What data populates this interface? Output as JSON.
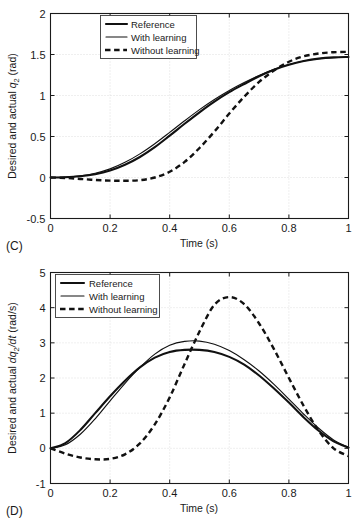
{
  "figure": {
    "panels": [
      {
        "letter": "(C)",
        "ylabel_prefix": "Desired and actual ",
        "ylabel_symbol": "q",
        "ylabel_sub": "2",
        "ylabel_suffix": " (rad)",
        "xlabel": "Time (s)",
        "legend": [
          {
            "label": "Reference",
            "style": "solid-thick"
          },
          {
            "label": "With learning",
            "style": "solid-thin"
          },
          {
            "label": "Without learning",
            "style": "dashed"
          }
        ]
      },
      {
        "letter": "(D)",
        "ylabel_prefix": "Desired and actual ",
        "ylabel_symbol": "dq",
        "ylabel_sub": "2",
        "ylabel_mid": "/dt",
        "ylabel_suffix": " (rad/s)",
        "xlabel": "Time (s)",
        "legend": [
          {
            "label": "Reference",
            "style": "solid-thick"
          },
          {
            "label": "With learning",
            "style": "solid-thin"
          },
          {
            "label": "Without learning",
            "style": "dashed"
          }
        ]
      }
    ]
  },
  "chart_data": [
    {
      "type": "line",
      "title": "",
      "panel": "(C)",
      "xlabel": "Time (s)",
      "ylabel": "Desired and actual q2 (rad)",
      "xlim": [
        0,
        1
      ],
      "ylim": [
        -0.5,
        2
      ],
      "xticks": [
        0,
        0.2,
        0.4,
        0.6,
        0.8,
        1
      ],
      "xticklabels": [
        "0",
        "0.2",
        "0.4",
        "0.6",
        "0.8",
        "1"
      ],
      "yticks": [
        -0.5,
        0,
        0.5,
        1,
        1.5,
        2
      ],
      "yticklabels": [
        "-0.5",
        "0",
        "0.5",
        "1",
        "1.5",
        "2"
      ],
      "grid": true,
      "legend_position": "upper-left",
      "x": [
        0,
        0.05,
        0.1,
        0.15,
        0.2,
        0.25,
        0.3,
        0.35,
        0.4,
        0.45,
        0.5,
        0.55,
        0.6,
        0.65,
        0.7,
        0.75,
        0.8,
        0.85,
        0.9,
        0.95,
        1
      ],
      "series": [
        {
          "name": "Reference",
          "style": "solid-thick",
          "values": [
            0,
            0.003,
            0.015,
            0.04,
            0.085,
            0.155,
            0.25,
            0.37,
            0.51,
            0.655,
            0.795,
            0.925,
            1.04,
            1.14,
            1.235,
            1.315,
            1.375,
            1.42,
            1.45,
            1.465,
            1.47
          ]
        },
        {
          "name": "With learning",
          "style": "solid-thin",
          "values": [
            0,
            0.004,
            0.02,
            0.052,
            0.105,
            0.185,
            0.288,
            0.412,
            0.55,
            0.692,
            0.828,
            0.952,
            1.062,
            1.158,
            1.245,
            1.32,
            1.378,
            1.42,
            1.448,
            1.462,
            1.468
          ]
        },
        {
          "name": "Without learning",
          "style": "dashed",
          "values": [
            0,
            -0.006,
            -0.018,
            -0.03,
            -0.038,
            -0.04,
            -0.032,
            0.0,
            0.07,
            0.19,
            0.36,
            0.56,
            0.78,
            0.985,
            1.165,
            1.305,
            1.412,
            1.478,
            1.512,
            1.528,
            1.532
          ]
        }
      ]
    },
    {
      "type": "line",
      "title": "",
      "panel": "(D)",
      "xlabel": "Time (s)",
      "ylabel": "Desired and actual dq2/dt (rad/s)",
      "xlim": [
        0,
        1
      ],
      "ylim": [
        -1,
        5
      ],
      "xticks": [
        0,
        0.2,
        0.4,
        0.6,
        0.8,
        1
      ],
      "xticklabels": [
        "0",
        "0.2",
        "0.4",
        "0.6",
        "0.8",
        "1"
      ],
      "yticks": [
        -1,
        0,
        1,
        2,
        3,
        4,
        5
      ],
      "yticklabels": [
        "-1",
        "0",
        "1",
        "2",
        "3",
        "4",
        "5"
      ],
      "grid": true,
      "legend_position": "upper-left",
      "x": [
        0,
        0.05,
        0.1,
        0.15,
        0.2,
        0.25,
        0.3,
        0.35,
        0.4,
        0.45,
        0.5,
        0.55,
        0.6,
        0.65,
        0.7,
        0.75,
        0.8,
        0.85,
        0.9,
        0.95,
        1
      ],
      "series": [
        {
          "name": "Reference",
          "style": "solid-thick",
          "values": [
            0,
            0.15,
            0.52,
            1.0,
            1.48,
            1.92,
            2.3,
            2.58,
            2.74,
            2.8,
            2.8,
            2.74,
            2.6,
            2.38,
            2.07,
            1.7,
            1.3,
            0.88,
            0.5,
            0.2,
            0.02
          ]
        },
        {
          "name": "With learning",
          "style": "solid-thin",
          "values": [
            0,
            0.1,
            0.4,
            0.84,
            1.35,
            1.85,
            2.3,
            2.68,
            2.93,
            3.04,
            3.05,
            2.96,
            2.78,
            2.52,
            2.2,
            1.82,
            1.4,
            0.97,
            0.57,
            0.24,
            0.03
          ]
        },
        {
          "name": "Without learning",
          "style": "dashed",
          "values": [
            0,
            -0.15,
            -0.26,
            -0.31,
            -0.3,
            -0.17,
            0.14,
            0.68,
            1.45,
            2.4,
            3.32,
            4.08,
            4.3,
            4.1,
            3.55,
            2.82,
            2.0,
            1.2,
            0.5,
            0.0,
            -0.22
          ]
        }
      ]
    }
  ]
}
